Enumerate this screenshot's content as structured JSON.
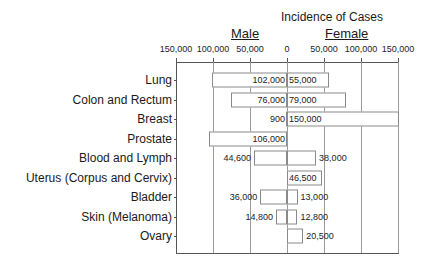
{
  "chart_data": {
    "type": "bar",
    "orientation": "horizontal",
    "layout": "butterfly",
    "title": "Incidence of Cases",
    "left_label": "Male",
    "right_label": "Female",
    "xlabel": "",
    "ylabel": "",
    "xlim": [
      -150000,
      150000
    ],
    "x_tick_labels": [
      "150,000",
      "100,000",
      "50,000",
      "0",
      "50,000",
      "100,000",
      "150,000"
    ],
    "x_tick_values": [
      -150000,
      -100000,
      -50000,
      0,
      50000,
      100000,
      150000
    ],
    "grid": true,
    "legend": null,
    "categories": [
      "Lung",
      "Colon and Rectum",
      "Breast",
      "Prostate",
      "Blood and Lymph",
      "Uterus (Corpus and Cervix)",
      "Bladder",
      "Skin (Melanoma)",
      "Ovary"
    ],
    "series": [
      {
        "name": "Male",
        "values": [
          102000,
          76000,
          900,
          106000,
          44600,
          null,
          36000,
          14800,
          null
        ],
        "labels": [
          "102,000",
          "76,000",
          "900",
          "106,000",
          "44,600",
          "",
          "36,000",
          "14,800",
          ""
        ]
      },
      {
        "name": "Female",
        "values": [
          55000,
          79000,
          150000,
          null,
          38000,
          46500,
          13000,
          12800,
          20500
        ],
        "labels": [
          "55,000",
          "79,000",
          "150,000",
          "",
          "38,000",
          "46,500",
          "13,000",
          "12,800",
          "20,500"
        ]
      }
    ]
  }
}
